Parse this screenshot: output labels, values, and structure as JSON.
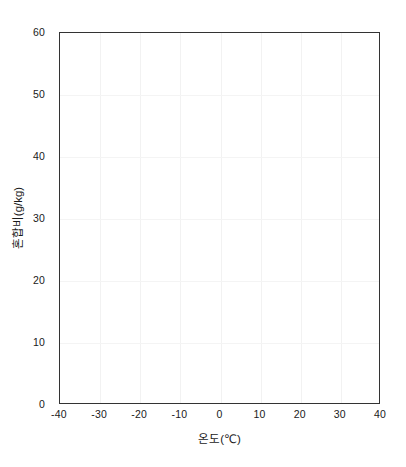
{
  "chart_data": {
    "type": "line",
    "title": "",
    "subtitle": "",
    "xlabel": "온도(℃)",
    "ylabel": "혼합비(g/kg)",
    "xlim": [
      -40,
      40
    ],
    "ylim": [
      0,
      60
    ],
    "xticks": [
      -40,
      -30,
      -20,
      -10,
      0,
      10,
      20,
      30,
      40
    ],
    "yticks": [
      0,
      10,
      20,
      30,
      40,
      50,
      60
    ],
    "xtick_labels": [
      "-40",
      "-30",
      "-20",
      "-10",
      "0",
      "10",
      "20",
      "30",
      "40"
    ],
    "ytick_labels": [
      "0",
      "10",
      "20",
      "30",
      "40",
      "50",
      "60"
    ],
    "grid": true,
    "grid_color": "#f2f2f2",
    "legend": null,
    "legend_position": "none",
    "series": [],
    "annotations": [],
    "frame_color": "#333333",
    "background_color": "#ffffff",
    "note": "Empty plot frame — no data series are drawn inside the axes."
  },
  "axes": {
    "x_axis_title": "온도(℃)",
    "y_axis_title": "혼합비(g/kg)"
  }
}
